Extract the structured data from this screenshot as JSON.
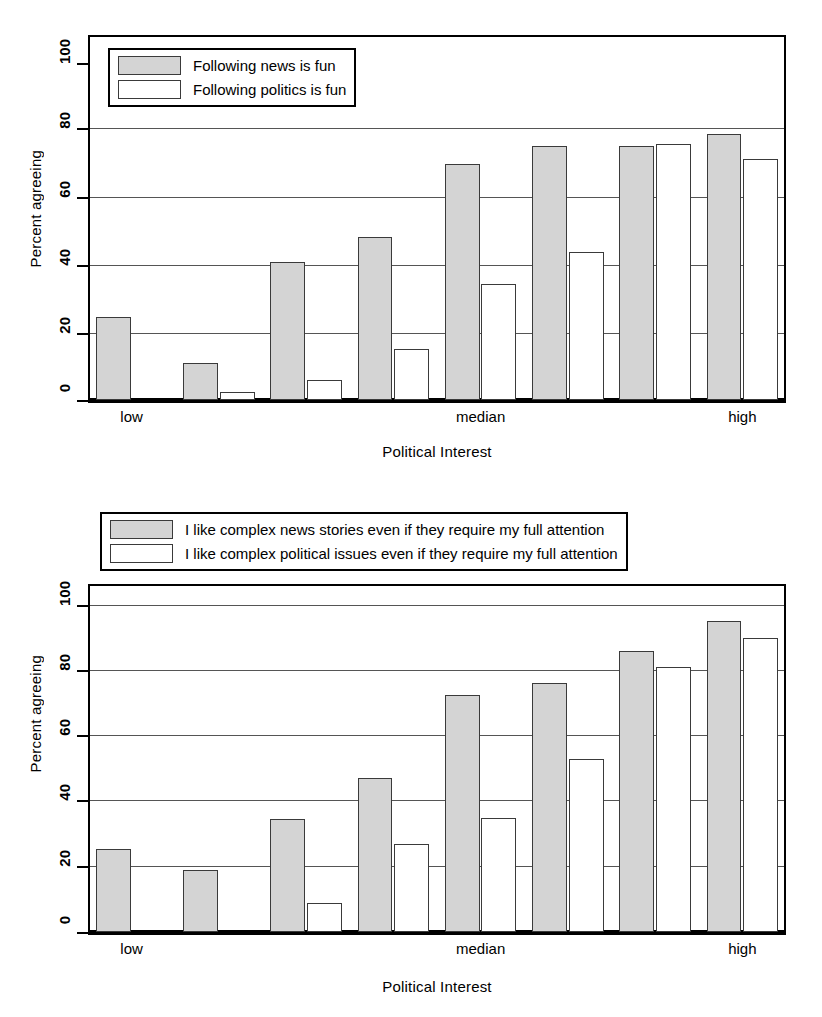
{
  "chart_data": [
    {
      "id": "top",
      "type": "bar",
      "title": "",
      "xlabel": "Political Interest",
      "ylabel": "Percent agreeing",
      "ylim": [
        0,
        100
      ],
      "yticks": [
        0,
        20,
        40,
        60,
        80,
        100
      ],
      "ytick_labels": [
        "0",
        "20",
        "40",
        "60",
        "80",
        "100"
      ],
      "grid": true,
      "legend_position": "upper left",
      "categories": [
        "1",
        "2",
        "3",
        "4",
        "5",
        "6",
        "7",
        "8"
      ],
      "xtick_labels": [
        "low",
        "median",
        "high"
      ],
      "xtick_positions": [
        1,
        5,
        8
      ],
      "series": [
        {
          "name": "Following news is fun",
          "color": "#d4d4d4",
          "values": [
            24.5,
            11,
            41,
            48.5,
            70,
            75.5,
            75.5,
            79
          ]
        },
        {
          "name": "Following politics is fun",
          "color": "#ffffff",
          "values": [
            0,
            2.5,
            6,
            15,
            34.5,
            44,
            76,
            71.5
          ]
        }
      ]
    },
    {
      "id": "bottom",
      "type": "bar",
      "title": "",
      "xlabel": "Political Interest",
      "ylabel": "Percent agreeing",
      "ylim": [
        0,
        100
      ],
      "yticks": [
        0,
        20,
        40,
        60,
        80,
        100
      ],
      "ytick_labels": [
        "0",
        "20",
        "40",
        "60",
        "80",
        "100"
      ],
      "grid": true,
      "legend_position": "above axes",
      "categories": [
        "1",
        "2",
        "3",
        "4",
        "5",
        "6",
        "7",
        "8"
      ],
      "xtick_labels": [
        "low",
        "median",
        "high"
      ],
      "xtick_positions": [
        1,
        5,
        8
      ],
      "series": [
        {
          "name": "I like complex news stories even if they require my full attention",
          "color": "#d4d4d4",
          "values": [
            25.5,
            19,
            34.5,
            47,
            72.5,
            76,
            86,
            95
          ]
        },
        {
          "name": "I like complex political issues even if they require my full attention",
          "color": "#ffffff",
          "values": [
            0,
            0,
            9,
            27,
            35,
            53,
            81,
            90
          ]
        }
      ]
    }
  ],
  "charts": {
    "top": {
      "ylabel": "Percent agreeing",
      "xlabel": "Political Interest",
      "ytick_labels": [
        "100",
        "80",
        "60",
        "40",
        "20",
        "0"
      ],
      "xtick_labels": [
        "low",
        "median",
        "high"
      ],
      "legend": {
        "items": [
          {
            "label": "Following news is fun",
            "style": "gray"
          },
          {
            "label": "Following politics is fun",
            "style": "white"
          }
        ]
      }
    },
    "bottom": {
      "ylabel": "Percent agreeing",
      "xlabel": "Political Interest",
      "ytick_labels": [
        "100",
        "80",
        "60",
        "40",
        "20",
        "0"
      ],
      "xtick_labels": [
        "low",
        "median",
        "high"
      ],
      "legend": {
        "items": [
          {
            "label": "I like complex news stories even if they require my full attention",
            "style": "gray"
          },
          {
            "label": "I like complex political issues even if they require my full attention",
            "style": "white"
          }
        ]
      }
    }
  }
}
